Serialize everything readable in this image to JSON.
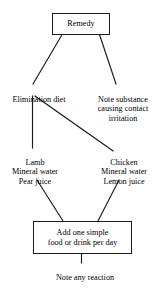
{
  "diagram": {
    "type": "flowchart",
    "title": "Remedy",
    "background_color": "#ffffff",
    "line_color": "#1a1a1a",
    "text_color": "#000000",
    "nodes": [
      {
        "id": "remedy",
        "label": "Remedy",
        "shape": "box"
      },
      {
        "id": "elimination_diet",
        "label": "Elimination diet",
        "shape": "plain"
      },
      {
        "id": "note_substance",
        "label": "Note substance\ncausing contact\nirritation",
        "shape": "plain"
      },
      {
        "id": "lamb_group",
        "label": "Lamb\nMineral water\nPear juice",
        "shape": "plain"
      },
      {
        "id": "chicken_group",
        "label": "Chicken\nMineral water\nLemon juice",
        "shape": "plain"
      },
      {
        "id": "add_food",
        "label": "Add one simple\nfood or drink per day",
        "shape": "box"
      },
      {
        "id": "note_reaction",
        "label": "Note any reaction",
        "shape": "plain"
      }
    ],
    "edges": [
      {
        "from": "remedy",
        "to": "elimination_diet"
      },
      {
        "from": "remedy",
        "to": "note_substance"
      },
      {
        "from": "elimination_diet",
        "to": "lamb_group"
      },
      {
        "from": "elimination_diet",
        "to": "chicken_group"
      },
      {
        "from": "lamb_group",
        "to": "add_food"
      },
      {
        "from": "chicken_group",
        "to": "add_food"
      },
      {
        "from": "add_food",
        "to": "note_reaction"
      }
    ]
  }
}
